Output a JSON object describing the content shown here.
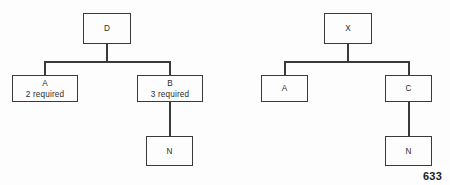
{
  "figure": {
    "page_number": "633",
    "stroke_color": "#3a3a3a",
    "background_color": "#fdfdfd",
    "text_color": "#2b2b2b",
    "diagrams": [
      {
        "name": "left-tree",
        "root": {
          "label": "D"
        },
        "nodes": [
          {
            "id": "D",
            "line1": "D",
            "line2": ""
          },
          {
            "id": "A",
            "line1": "A",
            "line2": "2 required"
          },
          {
            "id": "B",
            "line1": "B",
            "line2": "3 required"
          },
          {
            "id": "N",
            "line1": "N",
            "line2": ""
          }
        ]
      },
      {
        "name": "right-tree",
        "root": {
          "label": "X"
        },
        "nodes": [
          {
            "id": "X",
            "line1": "X",
            "line2": ""
          },
          {
            "id": "A",
            "line1": "A",
            "line2": ""
          },
          {
            "id": "C",
            "line1": "C",
            "line2": ""
          },
          {
            "id": "N",
            "line1": "N",
            "line2": ""
          }
        ]
      }
    ]
  }
}
